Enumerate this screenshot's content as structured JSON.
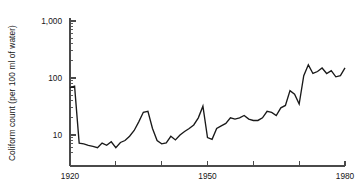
{
  "chart_data": {
    "type": "line",
    "title": "",
    "xlabel": "",
    "ylabel": "Coliform count (per 100 ml of water)",
    "yscale": "log",
    "ylim": [
      4,
      1000
    ],
    "xlim": [
      1920,
      1980
    ],
    "grid": false,
    "legend": null,
    "y_tick_labels": [
      "1,000",
      "100",
      "10"
    ],
    "y_tick_values": [
      1000,
      100,
      10
    ],
    "y_minor_ticks": [
      20,
      30,
      40,
      50,
      60,
      70,
      80,
      90,
      200,
      300,
      400,
      500,
      600,
      700,
      800,
      900,
      5,
      6,
      7,
      8,
      9
    ],
    "x_tick_labels": [
      "1920",
      "",
      "",
      "1950",
      "",
      "",
      "1980"
    ],
    "x_tick_values": [
      1920,
      1930,
      1940,
      1950,
      1960,
      1970,
      1980
    ],
    "line_color": "#1a1a1a",
    "axis_color": "#4a4a4a",
    "x": [
      1920,
      1921,
      1922,
      1923,
      1924,
      1925,
      1926,
      1927,
      1928,
      1929,
      1930,
      1931,
      1932,
      1933,
      1934,
      1935,
      1936,
      1937,
      1938,
      1939,
      1940,
      1941,
      1942,
      1943,
      1944,
      1945,
      1946,
      1947,
      1948,
      1949,
      1950,
      1951,
      1952,
      1953,
      1954,
      1955,
      1956,
      1957,
      1958,
      1959,
      1960,
      1961,
      1962,
      1963,
      1964,
      1965,
      1966,
      1967,
      1968,
      1969,
      1970,
      1971,
      1972,
      1973,
      1974,
      1975,
      1976,
      1977,
      1978,
      1979,
      1980
    ],
    "values": [
      68,
      72,
      7.2,
      7.0,
      6.6,
      6.3,
      6.0,
      7.2,
      6.6,
      7.6,
      6.0,
      7.4,
      8.0,
      9.5,
      12,
      17,
      25,
      26,
      13,
      8.0,
      7.0,
      7.3,
      9.5,
      8.2,
      10,
      11.5,
      13,
      15,
      20,
      32,
      9.0,
      8.4,
      13,
      14.5,
      16,
      20,
      19,
      20,
      22,
      19,
      18,
      18,
      20,
      26,
      25,
      22,
      30,
      33,
      60,
      52,
      35,
      110,
      170,
      120,
      130,
      150,
      120,
      135,
      105,
      110,
      150
    ]
  }
}
